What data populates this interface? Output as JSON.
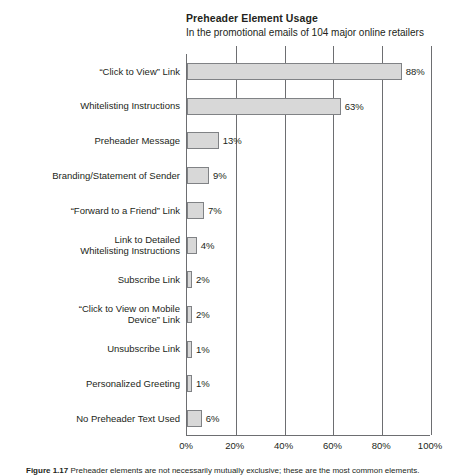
{
  "chart_data": {
    "type": "bar",
    "orientation": "horizontal",
    "title": "Preheader Element Usage",
    "subtitle": "In the promotional emails of 104 major online retailers",
    "xlabel": "",
    "ylabel": "",
    "xlim": [
      0,
      100
    ],
    "xticks": [
      "0%",
      "20%",
      "40%",
      "60%",
      "80%",
      "100%"
    ],
    "xtick_values": [
      0,
      20,
      40,
      60,
      80,
      100
    ],
    "grid": true,
    "grid_axis": "x",
    "legend": false,
    "categories": [
      "“Click to View” Link",
      "Whitelisting Instructions",
      "Preheader Message",
      "Branding/Statement of Sender",
      "“Forward to a Friend” Link",
      "Link to Detailed\nWhitelisting Instructions",
      "Subscribe Link",
      "“Click to View on Mobile\nDevice” Link",
      "Unsubscribe Link",
      "Personalized Greeting",
      "No Preheader Text Used"
    ],
    "values": [
      88,
      63,
      13,
      9,
      7,
      4,
      2,
      2,
      1,
      1,
      6
    ],
    "value_labels": [
      "88%",
      "63%",
      "13%",
      "9%",
      "7%",
      "4%",
      "2%",
      "2%",
      "1%",
      "1%",
      "6%"
    ],
    "bar_fill_color": "#d8d8d8",
    "bar_edge_color": "#808285",
    "axis_color": "#6d6e71",
    "text_color": "#231f20",
    "background_color": "#ffffff"
  },
  "caption": {
    "label": "Figure 1.17",
    "text": "Preheader elements are not necessarily mutually exclusive; these are the most common elements."
  }
}
